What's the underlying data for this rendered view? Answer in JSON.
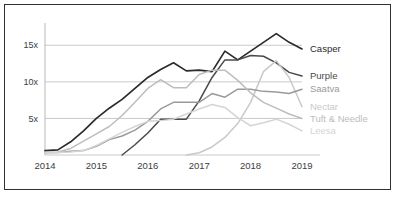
{
  "card": {
    "background": "#ffffff",
    "border_color": "#2f3234"
  },
  "chart_data": {
    "type": "line",
    "title": "",
    "subtitle": "",
    "xlabel": "",
    "ylabel": "",
    "grid": true,
    "legend_position": "right-inline",
    "x": [
      2014,
      2014.25,
      2014.5,
      2014.75,
      2015,
      2015.25,
      2015.5,
      2015.75,
      2016,
      2016.25,
      2016.5,
      2016.75,
      2017,
      2017.25,
      2017.5,
      2017.75,
      2018,
      2018.25,
      2018.5,
      2018.75,
      2019
    ],
    "xlim": [
      2014,
      2019
    ],
    "ylim": [
      0,
      17.5
    ],
    "ytick_values": [
      5,
      10,
      15
    ],
    "ytick_labels": [
      "5x",
      "10x",
      "15x"
    ],
    "xtick_values": [
      2014,
      2015,
      2016,
      2017,
      2018,
      2019
    ],
    "xtick_labels": [
      "2014",
      "2015",
      "2016",
      "2017",
      "2018",
      "2019"
    ],
    "series": [
      {
        "name": "Casper",
        "color": "#2b2b2b",
        "width": 1.7,
        "label": "Casper",
        "values": [
          0.6,
          0.7,
          1.8,
          3.3,
          5.0,
          6.4,
          7.6,
          9.1,
          10.6,
          11.7,
          12.6,
          11.5,
          11.6,
          11.4,
          14.2,
          13.0,
          14.2,
          15.4,
          16.6,
          15.4,
          14.5
        ]
      },
      {
        "name": "Purple",
        "color": "#4a4a4a",
        "width": 1.5,
        "label": "Purple",
        "values": [
          null,
          null,
          null,
          null,
          null,
          null,
          0.0,
          1.4,
          3.0,
          4.9,
          4.9,
          4.9,
          7.4,
          10.6,
          13.0,
          13.0,
          13.6,
          13.5,
          12.6,
          11.3,
          10.8
        ]
      },
      {
        "name": "Nectar",
        "color": "#c9c9c9",
        "width": 1.5,
        "label": "Nectar",
        "values": [
          null,
          null,
          null,
          null,
          null,
          null,
          null,
          null,
          null,
          null,
          null,
          0.0,
          0.3,
          1.1,
          2.4,
          4.3,
          7.2,
          11.4,
          12.9,
          10.6,
          6.6
        ]
      },
      {
        "name": "Saatva",
        "color": "#9a9a9a",
        "width": 1.5,
        "label": "Saatva",
        "values": [
          0.3,
          0.35,
          0.5,
          0.6,
          1.2,
          2.1,
          2.6,
          3.4,
          4.6,
          6.3,
          7.2,
          7.2,
          7.2,
          8.4,
          7.9,
          9.0,
          9.0,
          8.7,
          8.6,
          8.4,
          9.0
        ]
      },
      {
        "name": "Tuft & Needle",
        "color": "#bdbdbd",
        "width": 1.5,
        "label": "Tuft & Needle",
        "values": [
          0.35,
          0.4,
          0.9,
          1.9,
          2.9,
          3.9,
          5.4,
          7.2,
          9.1,
          10.3,
          9.2,
          9.2,
          11.0,
          11.6,
          11.6,
          10.2,
          8.5,
          7.2,
          6.4,
          5.6,
          5.0
        ]
      },
      {
        "name": "Leesa",
        "color": "#d5d5d5",
        "width": 1.5,
        "label": "Leesa",
        "values": [
          0.3,
          0.35,
          0.4,
          0.6,
          1.3,
          2.2,
          3.1,
          3.9,
          4.6,
          4.7,
          4.9,
          5.6,
          6.3,
          6.9,
          6.5,
          5.1,
          4.0,
          4.4,
          4.9,
          4.2,
          3.3
        ]
      }
    ]
  }
}
